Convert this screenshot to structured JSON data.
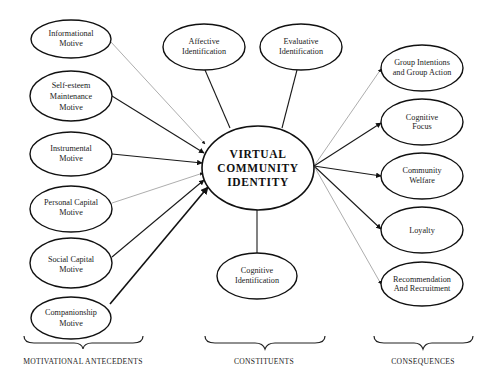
{
  "center": {
    "lines": [
      "VIRTUAL",
      "COMMUNITY",
      "IDENTITY"
    ]
  },
  "antecedents": [
    {
      "lines": [
        "Informational",
        "Motive"
      ],
      "edge": "light"
    },
    {
      "lines": [
        "Self-esteem",
        "Maintenance",
        "Motive"
      ],
      "edge": "dark"
    },
    {
      "lines": [
        "Instrumental",
        "Motive"
      ],
      "edge": "dark"
    },
    {
      "lines": [
        "Personal Capital",
        "Motive"
      ],
      "edge": "light"
    },
    {
      "lines": [
        "Social Capital",
        "Motive"
      ],
      "edge": "dark"
    },
    {
      "lines": [
        "Companionship",
        "Motive"
      ],
      "edge": "thick"
    }
  ],
  "constituents": [
    {
      "lines": [
        "Affective",
        "Identification"
      ]
    },
    {
      "lines": [
        "Evaluative",
        "Identification"
      ]
    },
    {
      "lines": [
        "Cognitive",
        "Identification"
      ]
    }
  ],
  "consequences": [
    {
      "lines": [
        "Group Intentions",
        "and Group Action"
      ],
      "edge": "light"
    },
    {
      "lines": [
        "Cognitive",
        "Focus"
      ],
      "edge": "dark"
    },
    {
      "lines": [
        "Community",
        "Welfare"
      ],
      "edge": "dark"
    },
    {
      "lines": [
        "Loyalty"
      ],
      "edge": "dark"
    },
    {
      "lines": [
        "Recommendation",
        "And Recruitment"
      ],
      "edge": "light"
    }
  ],
  "groups": {
    "antecedents_label": "MOTIVATIONAL ANTECEDENTS",
    "constituents_label": "CONSTITUENTS",
    "consequences_label": "CONSEQUENCES"
  },
  "colors": {
    "line_dark": "#1a1a1a",
    "line_light": "#8a8a8a",
    "background": "#ffffff"
  }
}
